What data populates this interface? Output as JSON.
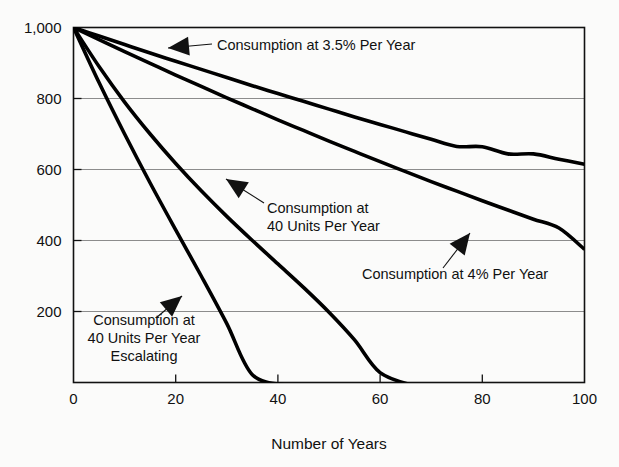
{
  "chart_data": {
    "type": "line",
    "title": "",
    "subtitle": "",
    "xlabel": "Number of  Years",
    "ylabel": "",
    "xlim": [
      0,
      100
    ],
    "ylim": [
      0,
      1000
    ],
    "grid": true,
    "grid_axis": "y",
    "legend_position": "none",
    "annotations_style": "inline-callouts-with-arrows",
    "x_ticks": [
      {
        "value": 0,
        "label": "0"
      },
      {
        "value": 20,
        "label": "20"
      },
      {
        "value": 40,
        "label": "40"
      },
      {
        "value": 60,
        "label": "60"
      },
      {
        "value": 80,
        "label": "80"
      },
      {
        "value": 100,
        "label": "100"
      }
    ],
    "y_ticks": [
      {
        "value": 200,
        "label": "200"
      },
      {
        "value": 400,
        "label": "400"
      },
      {
        "value": 600,
        "label": "600"
      },
      {
        "value": 800,
        "label": "800"
      },
      {
        "value": 1000,
        "label": "1,000"
      }
    ],
    "x": [
      0,
      5,
      10,
      15,
      20,
      25,
      30,
      35,
      40,
      45,
      50,
      55,
      60,
      65,
      70,
      75,
      80,
      85,
      90,
      95,
      100
    ],
    "series": [
      {
        "name": "Consumption at 3.5% Per Year",
        "color": "#000000",
        "values": [
          1000,
          976,
          952,
          928,
          905,
          882,
          859,
          836,
          814,
          792,
          770,
          748,
          727,
          706,
          685,
          665,
          664,
          644,
          644,
          629,
          615
        ]
      },
      {
        "name": "Consumption at 4% Per Year",
        "color": "#000000",
        "values": [
          1000,
          966,
          932,
          899,
          866,
          834,
          802,
          771,
          740,
          710,
          680,
          651,
          622,
          594,
          566,
          539,
          512,
          486,
          460,
          435,
          375
        ]
      },
      {
        "name": "Consumption at 40 Units Per Year",
        "color": "#000000",
        "values": [
          1000,
          890,
          790,
          700,
          617,
          540,
          468,
          400,
          334,
          268,
          198,
          120,
          28,
          0,
          0,
          0,
          0,
          0,
          0,
          0,
          0
        ]
      },
      {
        "name": "Consumption at 40 Units Per Year Escalating",
        "color": "#000000",
        "values": [
          1000,
          845,
          700,
          562,
          430,
          300,
          166,
          22,
          0,
          0,
          0,
          0,
          0,
          0,
          0,
          0,
          0,
          0,
          0,
          0,
          0
        ]
      }
    ],
    "annotations": [
      {
        "id": "annot-3-5-percent",
        "lines": [
          "Consumption at 3.5% Per Year"
        ],
        "text_anchor": "start",
        "text_x": 217,
        "text_y": 50,
        "arrow_tip_x": 168,
        "arrow_tip_y": 48,
        "arrow_tail_x": 212,
        "arrow_tail_y": 44
      },
      {
        "id": "annot-40-units",
        "lines": [
          "Consumption at",
          "40 Units Per Year"
        ],
        "text_anchor": "start",
        "text_x": 267,
        "text_y": 213,
        "arrow_tip_x": 226,
        "arrow_tip_y": 179,
        "arrow_tail_x": 264,
        "arrow_tail_y": 203
      },
      {
        "id": "annot-4-percent",
        "lines": [
          "Consumption at 4% Per Year"
        ],
        "text_anchor": "start",
        "text_x": 362,
        "text_y": 279,
        "arrow_tip_x": 470,
        "arrow_tip_y": 233,
        "arrow_tail_x": 443,
        "arrow_tail_y": 268
      },
      {
        "id": "annot-40-units-escalating",
        "lines": [
          "Consumption at",
          "40 Units Per Year",
          "Escalating"
        ],
        "text_anchor": "middle",
        "text_x": 144,
        "text_y": 325,
        "arrow_tip_x": 182,
        "arrow_tip_y": 296,
        "arrow_tail_x": 156,
        "arrow_tail_y": 318
      }
    ]
  },
  "style": {
    "plot_background": "#fbfbfa",
    "axis_color": "#111111",
    "grid_color": "#8c8c8c",
    "curve_color": "#000000",
    "text_color": "#111111"
  }
}
